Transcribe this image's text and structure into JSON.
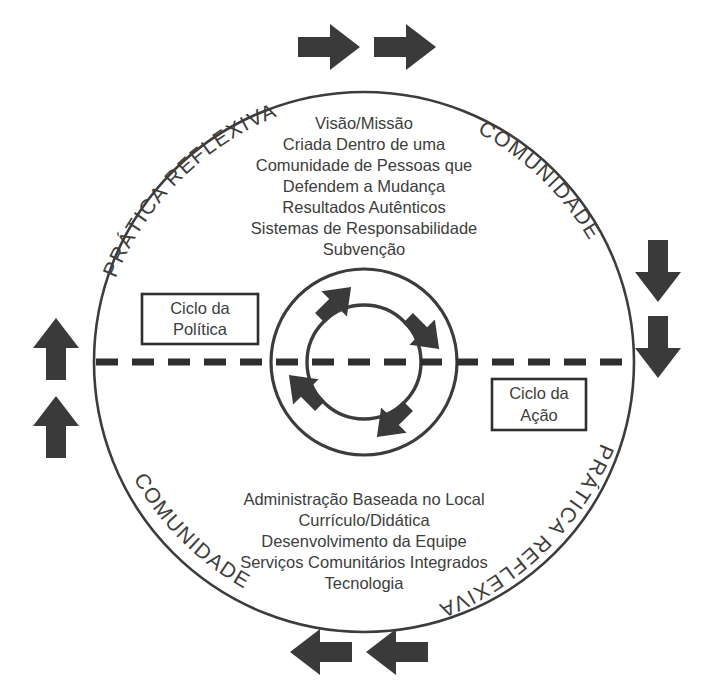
{
  "diagram": {
    "colors": {
      "stroke": "#3c3c3c",
      "text": "#3d3d3d",
      "arrow": "#3a3a3a",
      "divider": "#2f2f2f",
      "background": "#ffffff"
    },
    "outer_labels": [
      {
        "id": "top-left",
        "text": "PRÁTICA REFLEXIVA"
      },
      {
        "id": "top-right",
        "text": "COMUNIDADE"
      },
      {
        "id": "bottom-left",
        "text": "COMUNIDADE"
      },
      {
        "id": "bottom-right",
        "text": "PRÁTICA REFLEXIVA"
      }
    ],
    "top_section": {
      "lines": [
        "Visão/Missão",
        "Criada Dentro de uma",
        "Comunidade de Pessoas que",
        "Defendem a Mudança",
        "Resultados Autênticos",
        "Sistemas de Responsabilidade",
        "Subvenção"
      ]
    },
    "bottom_section": {
      "lines": [
        "Administração Baseada no Local",
        "Currículo/Didática",
        "Desenvolvimento da Equipe",
        "Serviços Comunitários Integrados",
        "Tecnologia"
      ]
    },
    "callouts": [
      {
        "id": "policy",
        "line1": "Ciclo da",
        "line2": "Política"
      },
      {
        "id": "action",
        "line1": "Ciclo da",
        "line2": "Ação"
      }
    ],
    "outer_arrows": [
      {
        "id": "top-1",
        "direction": "right"
      },
      {
        "id": "top-2",
        "direction": "right"
      },
      {
        "id": "right-1",
        "direction": "down"
      },
      {
        "id": "right-2",
        "direction": "down"
      },
      {
        "id": "bottom-1",
        "direction": "left"
      },
      {
        "id": "bottom-2",
        "direction": "left"
      },
      {
        "id": "left-1",
        "direction": "up"
      },
      {
        "id": "left-2",
        "direction": "up"
      }
    ],
    "inner_arrows": [
      {
        "id": "ne",
        "direction": "north-east"
      },
      {
        "id": "se",
        "direction": "south-east"
      },
      {
        "id": "sw",
        "direction": "south-west"
      },
      {
        "id": "nw",
        "direction": "north-west"
      }
    ]
  }
}
